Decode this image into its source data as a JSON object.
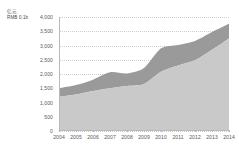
{
  "chart_data": {
    "type": "area",
    "stacked": true,
    "title": "",
    "subtitle": "",
    "unit_label_line1": "亿元",
    "unit_label_line2": "RMB 0.1b",
    "xlabel": "",
    "ylabel": "",
    "categories": [
      "2004",
      "2005",
      "2006",
      "2007",
      "2008",
      "2009",
      "2010",
      "2011",
      "2012",
      "2013",
      "2014"
    ],
    "x": [
      2004,
      2005,
      2006,
      2007,
      2008,
      2009,
      2010,
      2011,
      2012,
      2013,
      2014
    ],
    "ylim": [
      0,
      4000
    ],
    "ytick_values": [
      0,
      500,
      1000,
      1500,
      2000,
      2500,
      3000,
      3500,
      4000
    ],
    "ytick_labels": [
      "0",
      "500",
      "1,000",
      "1,500",
      "2,000",
      "2,500",
      "3,000",
      "3,500",
      "4,000"
    ],
    "grid": true,
    "grid_style": "dotted-horizontal",
    "legend": "none",
    "series": [
      {
        "name": "lower-series",
        "color": "#c9c9c9",
        "values": [
          1200,
          1280,
          1400,
          1500,
          1580,
          1650,
          2080,
          2300,
          2480,
          2850,
          3250
        ]
      },
      {
        "name": "upper-series",
        "color": "#9a9a9a",
        "values": [
          300,
          330,
          400,
          560,
          440,
          560,
          820,
          720,
          680,
          620,
          510
        ]
      }
    ],
    "totals": [
      1500,
      1610,
      1800,
      2060,
      2020,
      2210,
      2900,
      3020,
      3160,
      3470,
      3760
    ]
  },
  "colors": {
    "lower_area": "#c9c9c9",
    "upper_area": "#9a9a9a",
    "axis": "#b9b9b9",
    "grid": "#cfcfcf",
    "tick_text": "#555555",
    "caption_text": "#4a4a4a",
    "background": "#ffffff"
  }
}
